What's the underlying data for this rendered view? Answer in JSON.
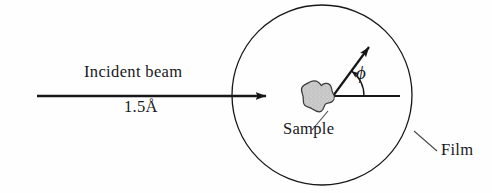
{
  "figure": {
    "name": "x-ray-diffraction-camera-schematic",
    "background_color": "#fefefe",
    "ink_color": "#17171a",
    "labels": {
      "incident_beam": "Incident beam",
      "wavelength": "1.5Å",
      "sample": "Sample",
      "film": "Film",
      "angle_symbol": "ϕ"
    }
  },
  "diagram_data": {
    "type": "schematic",
    "title": "Incident beam striking a sample inside a circular film, diffracted at angle phi",
    "elements": [
      {
        "name": "film-circle",
        "role": "detector",
        "label": "Film",
        "shape": "circle",
        "center": [
          322,
          95
        ],
        "radius": 90,
        "stroke": "#17171a",
        "stroke_width": 1.3,
        "fill": "none"
      },
      {
        "name": "incident-beam-arrow",
        "role": "incoming-ray",
        "label": "Incident beam",
        "sublabel": "1.5Å",
        "shape": "arrow",
        "from": [
          37,
          96
        ],
        "to": [
          272,
          96
        ],
        "stroke": "#17171a",
        "stroke_width": 2.6
      },
      {
        "name": "sample-blob",
        "role": "specimen",
        "label": "Sample",
        "shape": "irregular-blob",
        "center": [
          317,
          97
        ],
        "bounds": [
          302,
          81,
          33,
          33
        ],
        "fill": "#c9c9c9",
        "stroke": "#3a3a3a"
      },
      {
        "name": "reference-axis-line",
        "role": "angle-reference",
        "shape": "line",
        "from": [
          333,
          96
        ],
        "to": [
          400,
          96
        ],
        "stroke": "#17171a",
        "stroke_width": 2.1
      },
      {
        "name": "diffracted-beam-arrow",
        "role": "outgoing-ray",
        "shape": "arrow",
        "from": [
          333,
          96
        ],
        "to": [
          373,
          42
        ],
        "stroke": "#17171a",
        "stroke_width": 2.2
      },
      {
        "name": "angle-arc",
        "role": "angle-indicator",
        "label": "ϕ",
        "shape": "arc",
        "vertex": [
          333,
          96
        ],
        "radius": 31,
        "start_angle_deg": 0,
        "end_angle_deg": 53,
        "stroke": "#17171a",
        "stroke_width": 1.4
      },
      {
        "name": "sample-leader-line",
        "role": "callout",
        "shape": "line",
        "from": [
          327,
          112
        ],
        "to": [
          312,
          130
        ],
        "stroke": "#4a4a4a",
        "stroke_width": 1.1
      },
      {
        "name": "film-leader-line",
        "role": "callout",
        "shape": "line",
        "from": [
          415,
          132
        ],
        "to": [
          437,
          150
        ],
        "stroke": "#4a4a4a",
        "stroke_width": 1.1
      }
    ],
    "annotations": {
      "angle_between": [
        "reference-axis-line",
        "diffracted-beam-arrow"
      ],
      "angle_symbol": "ϕ",
      "beam_wavelength": "1.5Å"
    }
  }
}
